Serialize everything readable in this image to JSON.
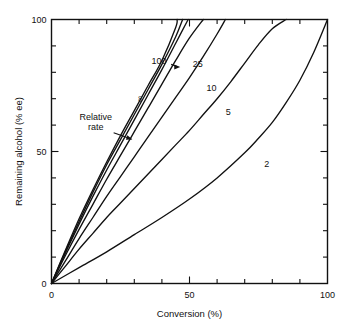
{
  "chart_data": {
    "type": "line",
    "title": "",
    "xlabel": "Conversion (%)",
    "ylabel": "Remaining alcohol (% ee)",
    "xlim": [
      0,
      100
    ],
    "ylim": [
      0,
      100
    ],
    "grid": false,
    "legend_position": "inline-curve-labels",
    "x_major_ticks": [
      0,
      50,
      100
    ],
    "x_major_tick_labels": [
      "0",
      "50",
      "100"
    ],
    "x_minor_ticks": [
      10,
      20,
      30,
      40,
      60,
      70,
      80,
      90
    ],
    "y_major_ticks": [
      0,
      50,
      100
    ],
    "y_major_tick_labels": [
      "0",
      "50",
      "100"
    ],
    "y_minor_ticks": [
      10,
      20,
      30,
      40,
      60,
      70,
      80,
      90
    ],
    "annotations": [
      {
        "name": "relative-rate",
        "text_line1": "Relative",
        "text_line2": "rate",
        "x": 16,
        "y": 62,
        "points_to_x": 30,
        "points_to_y": 54
      },
      {
        "name": "rate-100-arrow",
        "text": "100",
        "x": 39,
        "y": 83,
        "points_to_x": 47,
        "points_to_y": 82
      }
    ],
    "series": [
      {
        "name": "∞",
        "label": "∞",
        "label_x": 33,
        "label_y": 70,
        "label_rotated": true,
        "x": [
          0,
          5,
          10,
          15,
          20,
          25,
          30,
          35,
          40,
          45,
          45.5
        ],
        "y": [
          0,
          12.5,
          24.5,
          35.5,
          46,
          56,
          65.5,
          75,
          84.5,
          97,
          100
        ]
      },
      {
        "name": "100",
        "label": "100",
        "label_x": 39,
        "label_y": 83,
        "x": [
          0,
          5,
          10,
          15,
          20,
          25,
          30,
          35,
          40,
          45,
          47.5
        ],
        "y": [
          0,
          12,
          23.5,
          34.5,
          45,
          54.5,
          64,
          73.5,
          83,
          93.5,
          100
        ]
      },
      {
        "name": "50",
        "label": "",
        "label_x": null,
        "label_y": null,
        "x": [
          0,
          5,
          10,
          15,
          20,
          25,
          30,
          35,
          40,
          45,
          49.5
        ],
        "y": [
          0,
          11.5,
          22.5,
          33,
          43,
          52.5,
          62,
          71.5,
          81,
          91,
          100
        ]
      },
      {
        "name": "25",
        "label": "25",
        "label_x": 53,
        "label_y": 82,
        "x": [
          0,
          5,
          10,
          15,
          20,
          25,
          30,
          35,
          40,
          45,
          50,
          55
        ],
        "y": [
          0,
          10.5,
          20.5,
          30,
          39.5,
          48.5,
          57.5,
          66.5,
          75.5,
          84.5,
          93,
          100
        ]
      },
      {
        "name": "10",
        "label": "10",
        "label_x": 58,
        "label_y": 73,
        "x": [
          0,
          5,
          10,
          15,
          20,
          25,
          30,
          35,
          40,
          45,
          50,
          55,
          60,
          63
        ],
        "y": [
          0,
          8.5,
          17,
          25,
          33,
          40.5,
          48,
          55.5,
          63,
          70.5,
          78,
          86,
          94.5,
          100
        ]
      },
      {
        "name": "5",
        "label": "5",
        "label_x": 64,
        "label_y": 64,
        "x": [
          0,
          5,
          10,
          15,
          20,
          25,
          30,
          35,
          40,
          45,
          50,
          55,
          60,
          65,
          70,
          75,
          80,
          85
        ],
        "y": [
          0,
          6.5,
          13,
          19,
          25,
          30.5,
          36,
          41.5,
          47,
          52.5,
          58,
          64,
          70,
          76.5,
          83.5,
          90.5,
          96.5,
          100
        ]
      },
      {
        "name": "2",
        "label": "2",
        "label_x": 78,
        "label_y": 44,
        "x": [
          0,
          10,
          20,
          30,
          40,
          50,
          60,
          70,
          75,
          80,
          85,
          90,
          95,
          100
        ],
        "y": [
          0,
          6,
          12,
          18.5,
          25,
          32,
          40,
          49.5,
          55,
          61,
          68.5,
          77,
          87.5,
          100
        ]
      }
    ]
  }
}
